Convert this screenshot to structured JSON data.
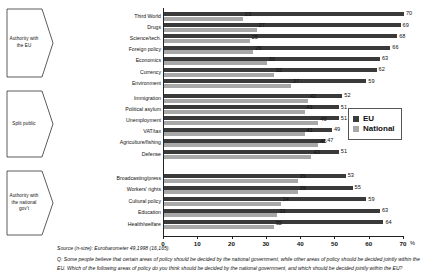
{
  "chart_data": {
    "type": "bar",
    "orientation": "horizontal",
    "title": "",
    "xlabel": "%",
    "ylabel": "",
    "xlim": [
      0,
      70
    ],
    "xticks": [
      0,
      10,
      20,
      30,
      40,
      50,
      60,
      70
    ],
    "xtick_labels": [
      "0",
      "10",
      "20",
      "30",
      "40",
      "50",
      "60",
      "70"
    ],
    "percent_suffix": "%",
    "grid": false,
    "legend_position": "right",
    "categories": [
      "Third World",
      "Drugs",
      "Science/tech.",
      "Foreign policy",
      "Economics",
      "Currency",
      "Environment",
      "Immigration",
      "Political asylum",
      "Unemployment",
      "VAT/tax",
      "Agriculture/fishing",
      "Defense",
      "Broadcasting/press",
      "Workers' rights",
      "Cultural policy",
      "Education",
      "Health/welfare"
    ],
    "series": [
      {
        "name": "EU",
        "color": "#3a3a3a",
        "values": [
          70,
          69,
          68,
          66,
          63,
          62,
          59,
          52,
          51,
          51,
          49,
          47,
          51,
          53,
          55,
          59,
          63,
          64
        ]
      },
      {
        "name": "National",
        "color": "#a8a8a8",
        "values": [
          23,
          27,
          25,
          26,
          30,
          32,
          37,
          42,
          41,
          45,
          41,
          45,
          43,
          39,
          39,
          34,
          33,
          32
        ]
      }
    ],
    "groups": [
      {
        "label": "Authority with the EU",
        "start": 0,
        "end": 6
      },
      {
        "label": "Split public",
        "start": 7,
        "end": 12
      },
      {
        "label": "Authority with the national gov't",
        "start": 13,
        "end": 17
      }
    ]
  },
  "legend": {
    "items": [
      {
        "label": "EU",
        "color": "#3a3a3a"
      },
      {
        "label": "National",
        "color": "#a8a8a8"
      }
    ]
  },
  "axis": {
    "percent_label": "%"
  },
  "footer": {
    "source": "Source (n-size): Eurobarometer 49,1998 (16,165).",
    "question": "Q: Some people believe that certain areas of policy should be decided by the national government, while other areas of policy should be decided jointly within the EU. Which of the following areas of policy do you think should be decided by the national government, and which should be decided jointly within the EU?"
  }
}
